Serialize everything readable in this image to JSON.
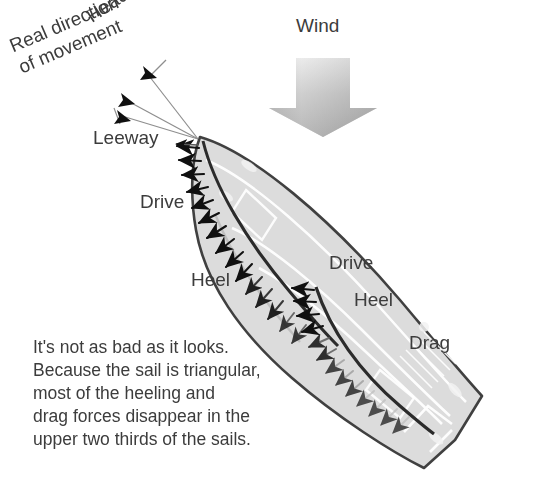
{
  "diagram": {
    "title_labels": {
      "wind": "Wind",
      "heading": "Heading",
      "real_direction": "Real direction\nof movement",
      "leeway": "Leeway"
    },
    "outer_force_labels": {
      "drive": "Drive",
      "heel": "Heel"
    },
    "inner_force_labels": {
      "drive": "Drive",
      "heel": "Heel",
      "drag": "Drag"
    },
    "caption_lines": [
      "It's not as bad as it looks.",
      "Because the sail is triangular,",
      "most of the heeling and",
      "drag forces disappear in the",
      "upper two thirds of the sails."
    ],
    "colors": {
      "background": "#ffffff",
      "text": "#3c3c3c",
      "hull_outline": "#404040",
      "hull_fill": "#dcdcdc",
      "deck_line": "#ffffff",
      "arrow_dark": "#1a1a1a",
      "arrow_fade": "#c9c9c9",
      "wind_arrow_light": "#fafafa",
      "wind_arrow_dark": "#9a9a9a",
      "leader_line": "#8c8c8c"
    }
  }
}
